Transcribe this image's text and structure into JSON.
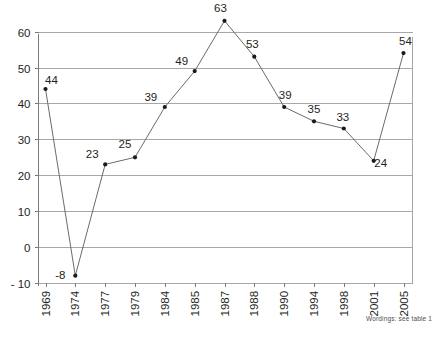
{
  "chart_data": {
    "type": "line",
    "title": "",
    "subtitle": "",
    "xlabel": "",
    "ylabel": "",
    "categories": [
      "1969",
      "1974",
      "1977",
      "1979",
      "1984",
      "1985",
      "1987",
      "1988",
      "1990",
      "1994",
      "1998",
      "2001",
      "2005"
    ],
    "values": [
      44,
      -8,
      23,
      25,
      39,
      49,
      63,
      53,
      39,
      35,
      33,
      24,
      54
    ],
    "point_labels": [
      "44",
      "-8",
      "23",
      "25",
      "39",
      "49",
      "63",
      "53",
      "39",
      "35",
      "33",
      "24",
      "54"
    ],
    "series": [
      {
        "name": "",
        "values": [
          44,
          -8,
          23,
          25,
          39,
          49,
          63,
          53,
          39,
          35,
          33,
          24,
          54
        ]
      }
    ],
    "ylim": [
      -10,
      65
    ],
    "yticks": [
      60,
      50,
      40,
      30,
      20,
      10,
      0,
      -10
    ],
    "ytick_labels": [
      "60",
      "50",
      "40",
      "30",
      "20",
      "10",
      "0",
      "- 10"
    ],
    "grid": true,
    "grid_axis": "y",
    "legend": "none",
    "annotations": [
      "Wordings: see table 1"
    ],
    "colors": {
      "line": "#6b6b6b",
      "marker": "#1a1a1a",
      "grid": "#a7a7a7",
      "axis": "#7a7a7a",
      "text": "#231f20",
      "footnote": "#4d4d4d",
      "background": "#ffffff"
    }
  },
  "footnote": {
    "text": "Wordings: see table 1"
  },
  "top_fragment": {
    "text": ""
  },
  "label_offsets": [
    {
      "dx": 6,
      "dy": -5
    },
    {
      "dx": -15,
      "dy": 3
    },
    {
      "dx": -13,
      "dy": -6
    },
    {
      "dx": -10,
      "dy": -9
    },
    {
      "dx": -14,
      "dy": -6
    },
    {
      "dx": -13,
      "dy": -6
    },
    {
      "dx": -4,
      "dy": -9
    },
    {
      "dx": -2,
      "dy": -9
    },
    {
      "dx": 1,
      "dy": -8
    },
    {
      "dx": 0,
      "dy": -8
    },
    {
      "dx": -1,
      "dy": -8
    },
    {
      "dx": 7,
      "dy": 6
    },
    {
      "dx": 2,
      "dy": -8
    }
  ]
}
